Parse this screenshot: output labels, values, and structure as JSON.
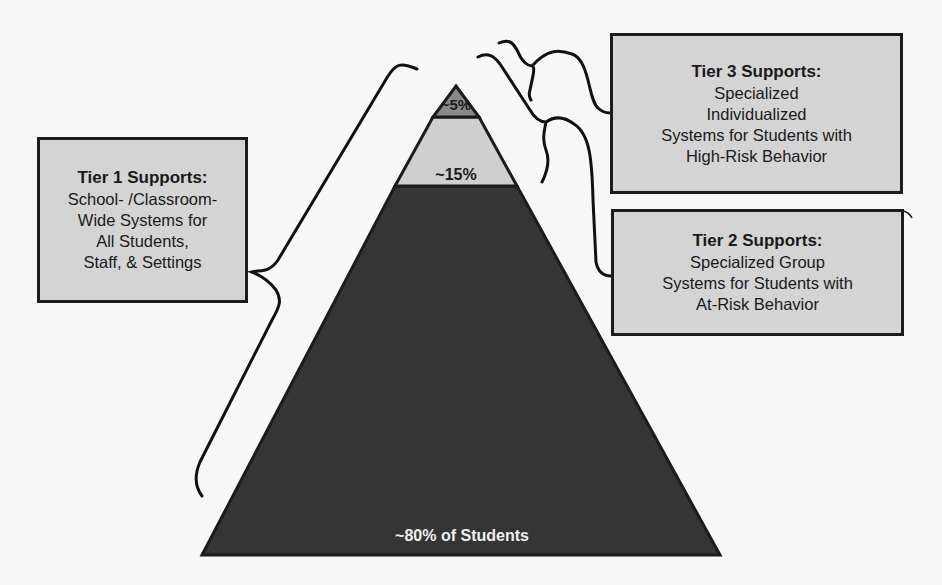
{
  "diagram": {
    "type": "tiered-pyramid",
    "colors": {
      "background": "#f7f7f7",
      "box_fill": "#d4d4d4",
      "outline": "#1c1c1c",
      "tier3_band": "#8a8a8a",
      "tier2_band": "#cfcfcf",
      "tier1_band": "#353535",
      "dark_text": "#1a1a1a",
      "light_text": "#f0f0f0"
    },
    "pyramid": {
      "bands": [
        {
          "id": "tier3",
          "label": "~5%",
          "percent": 5
        },
        {
          "id": "tier2",
          "label": "~15%",
          "percent": 15
        },
        {
          "id": "tier1",
          "label": "~80% of Students",
          "percent": 80
        }
      ]
    },
    "boxes": {
      "tier1": {
        "title": "Tier 1 Supports:",
        "lines": [
          "School- /Classroom-",
          "Wide Systems for",
          "All Students,",
          "Staff, & Settings"
        ]
      },
      "tier2": {
        "title": "Tier 2 Supports:",
        "lines": [
          "Specialized Group",
          "Systems for Students with",
          "At-Risk Behavior"
        ]
      },
      "tier3": {
        "title": "Tier 3 Supports:",
        "lines": [
          "Specialized",
          "Individualized",
          "Systems for Students with",
          "High-Risk Behavior"
        ]
      }
    }
  }
}
